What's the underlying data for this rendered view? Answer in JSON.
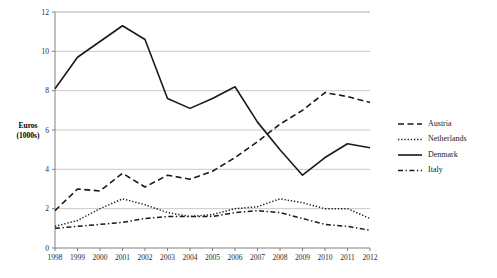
{
  "chart_data": {
    "type": "line",
    "title": "",
    "xlabel": "",
    "ylabel": "Euros\n(1000s)",
    "ylabel_line1": "Euros",
    "ylabel_line2": "(1000s)",
    "x": [
      1998,
      1999,
      2000,
      2001,
      2002,
      2003,
      2004,
      2005,
      2006,
      2007,
      2008,
      2009,
      2010,
      2011,
      2012
    ],
    "categories": [
      "1998",
      "1999",
      "2000",
      "2001",
      "2002",
      "2003",
      "2004",
      "2005",
      "2006",
      "2007",
      "2008",
      "2009",
      "2010",
      "2011",
      "2012"
    ],
    "xlim": [
      1998,
      2012
    ],
    "ylim": [
      0,
      12
    ],
    "yticks": [
      0,
      2,
      4,
      6,
      8,
      10,
      12
    ],
    "ytick_labels": [
      "0",
      "2",
      "4",
      "6",
      "8",
      "10",
      "12"
    ],
    "grid": true,
    "grid_axis": "y",
    "legend_position": "right",
    "series": [
      {
        "name": "Austria",
        "style": "dashed",
        "color": "#1a1a1a",
        "values": [
          1.9,
          3.0,
          2.9,
          3.8,
          3.1,
          3.7,
          3.5,
          3.9,
          4.6,
          5.4,
          6.3,
          7.0,
          7.9,
          7.7,
          7.4
        ]
      },
      {
        "name": "Netherlands",
        "style": "dotted",
        "color": "#1a1a1a",
        "values": [
          1.1,
          1.4,
          2.0,
          2.5,
          2.2,
          1.8,
          1.6,
          1.7,
          2.0,
          2.1,
          2.5,
          2.3,
          2.0,
          2.0,
          1.5
        ]
      },
      {
        "name": "Denmark",
        "style": "solid",
        "color": "#1a1a1a",
        "values": [
          8.1,
          9.7,
          10.5,
          11.3,
          10.6,
          7.6,
          7.1,
          7.6,
          8.2,
          6.4,
          5.0,
          3.7,
          4.6,
          5.3,
          5.1
        ]
      },
      {
        "name": "Italy",
        "style": "dashdot",
        "color": "#1a1a1a",
        "values": [
          1.0,
          1.1,
          1.2,
          1.3,
          1.5,
          1.6,
          1.6,
          1.6,
          1.8,
          1.9,
          1.8,
          1.5,
          1.2,
          1.1,
          0.9
        ]
      }
    ]
  },
  "legend": {
    "items": [
      {
        "label": "Austria"
      },
      {
        "label": "Netherlands"
      },
      {
        "label": "Denmark"
      },
      {
        "label": "Italy"
      }
    ]
  }
}
